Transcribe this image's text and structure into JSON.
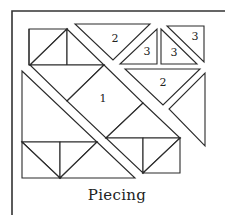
{
  "diagram": {
    "caption": "Piecing",
    "colors": {
      "line": "#2a2a2a",
      "background": "#ffffff"
    },
    "pieces": [
      {
        "id": "top-triangle-2",
        "label": "2"
      },
      {
        "id": "small-triangle-3-left",
        "label": "3"
      },
      {
        "id": "small-triangle-3-middle",
        "label": "3"
      },
      {
        "id": "small-triangle-3-right",
        "label": "3"
      },
      {
        "id": "center-square-1",
        "label": "1"
      },
      {
        "id": "right-triangle-2",
        "label": "2"
      }
    ]
  }
}
